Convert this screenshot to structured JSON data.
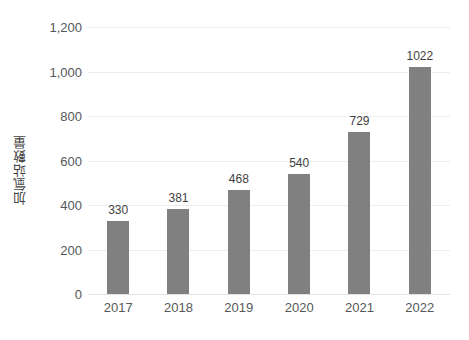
{
  "chart_data": {
    "type": "bar",
    "title": "",
    "subtitle": "",
    "xlabel": "",
    "ylabel": "加氫站數量",
    "categories": [
      "2017",
      "2018",
      "2019",
      "2020",
      "2021",
      "2022"
    ],
    "values": [
      330,
      381,
      468,
      540,
      729,
      1022
    ],
    "data_labels": [
      "330",
      "381",
      "468",
      "540",
      "729",
      "1022"
    ],
    "series": [
      {
        "name": "加氫站數量",
        "values": [
          330,
          381,
          468,
          540,
          729,
          1022
        ],
        "color": "#808080"
      }
    ],
    "ylim": [
      0,
      1200
    ],
    "y_ticks": [
      0,
      200,
      400,
      600,
      800,
      1000,
      1200
    ],
    "y_tick_labels": [
      "0",
      "200",
      "400",
      "600",
      "800",
      "1,000",
      "1,200"
    ],
    "grid": true,
    "grid_axis": "y",
    "legend": false,
    "legend_position": "none",
    "bar_color": "#808080",
    "gridline_color": "#eceded",
    "axis_text_color": "#555759",
    "label_text_color": "#3f3f3f",
    "background_color": "#ffffff"
  }
}
